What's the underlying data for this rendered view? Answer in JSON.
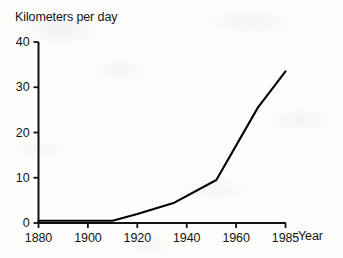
{
  "chart_data": {
    "type": "line",
    "title": "",
    "ylabel": "Kilometers per day",
    "xlabel": "Year",
    "x_tick_labels": [
      "1880",
      "1900",
      "1920",
      "1940",
      "1960",
      "1985"
    ],
    "x_tick_values": [
      1880,
      1900,
      1920,
      1940,
      1960,
      1985
    ],
    "y_tick_labels": [
      "0",
      "10",
      "20",
      "30",
      "40"
    ],
    "y_tick_values": [
      0,
      10,
      20,
      30,
      40
    ],
    "ylim": [
      0,
      40
    ],
    "xlim": [
      1880,
      1985
    ],
    "grid": false,
    "legend": false,
    "axis_note": "x tick 1985 spaced equally with 20-year intervals",
    "series": [
      {
        "name": "Kilometers per day",
        "color": "#000000",
        "x": [
          1880,
          1910,
          1920,
          1935,
          1952,
          1971,
          1985
        ],
        "values": [
          0.5,
          0.5,
          2.0,
          4.5,
          9.5,
          25.5,
          33.5
        ]
      }
    ]
  },
  "axes": {
    "y_title": "Kilometers per day",
    "x_title": "Year"
  }
}
